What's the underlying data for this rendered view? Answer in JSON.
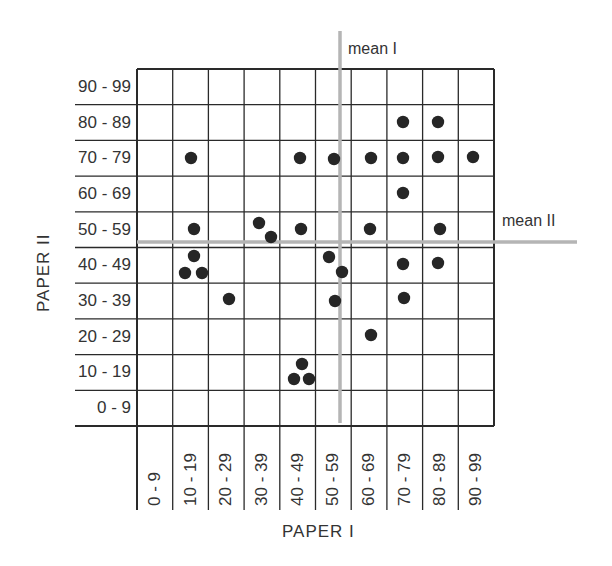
{
  "chart_data": {
    "type": "scatter",
    "title": "",
    "xlabel": "PAPER I",
    "ylabel": "PAPER II",
    "x_categories": [
      "0 - 9",
      "10 - 19",
      "20 - 29",
      "30 - 39",
      "40 - 49",
      "50 - 59",
      "60 - 69",
      "70 - 79",
      "80 - 89",
      "90 - 99"
    ],
    "y_categories": [
      "90 - 99",
      "80 - 89",
      "70 - 79",
      "60 - 69",
      "50 - 59",
      "40 - 49",
      "30 - 39",
      "20 - 29",
      "10 - 19",
      "0 - 9"
    ],
    "xlim": [
      0,
      100
    ],
    "ylim": [
      0,
      100
    ],
    "grid": true,
    "reference_lines": [
      {
        "label": "mean I",
        "axis": "x",
        "value": 57
      },
      {
        "label": "mean II",
        "axis": "y",
        "value": 48
      }
    ],
    "points_by_cell": [
      {
        "paper_I": "70 - 79",
        "paper_II": "80 - 89",
        "count": 1
      },
      {
        "paper_I": "80 - 89",
        "paper_II": "80 - 89",
        "count": 1
      },
      {
        "paper_I": "10 - 19",
        "paper_II": "70 - 79",
        "count": 1
      },
      {
        "paper_I": "40 - 49",
        "paper_II": "70 - 79",
        "count": 1
      },
      {
        "paper_I": "50 - 59",
        "paper_II": "70 - 79",
        "count": 1
      },
      {
        "paper_I": "60 - 69",
        "paper_II": "70 - 79",
        "count": 1
      },
      {
        "paper_I": "70 - 79",
        "paper_II": "70 - 79",
        "count": 1
      },
      {
        "paper_I": "80 - 89",
        "paper_II": "70 - 79",
        "count": 1
      },
      {
        "paper_I": "90 - 99",
        "paper_II": "70 - 79",
        "count": 1
      },
      {
        "paper_I": "70 - 79",
        "paper_II": "60 - 69",
        "count": 1
      },
      {
        "paper_I": "10 - 19",
        "paper_II": "50 - 59",
        "count": 1
      },
      {
        "paper_I": "30 - 39",
        "paper_II": "50 - 59",
        "count": 2
      },
      {
        "paper_I": "40 - 49",
        "paper_II": "50 - 59",
        "count": 1
      },
      {
        "paper_I": "60 - 69",
        "paper_II": "50 - 59",
        "count": 1
      },
      {
        "paper_I": "80 - 89",
        "paper_II": "50 - 59",
        "count": 1
      },
      {
        "paper_I": "10 - 19",
        "paper_II": "40 - 49",
        "count": 3
      },
      {
        "paper_I": "50 - 59",
        "paper_II": "40 - 49",
        "count": 2
      },
      {
        "paper_I": "70 - 79",
        "paper_II": "40 - 49",
        "count": 1
      },
      {
        "paper_I": "80 - 89",
        "paper_II": "40 - 49",
        "count": 1
      },
      {
        "paper_I": "20 - 29",
        "paper_II": "30 - 39",
        "count": 1
      },
      {
        "paper_I": "50 - 59",
        "paper_II": "30 - 39",
        "count": 1
      },
      {
        "paper_I": "70 - 79",
        "paper_II": "30 - 39",
        "count": 1
      },
      {
        "paper_I": "60 - 69",
        "paper_II": "20 - 29",
        "count": 1
      },
      {
        "paper_I": "40 - 49",
        "paper_II": "10 - 19",
        "count": 3
      }
    ],
    "total_points": 30
  },
  "plot": {
    "left": 137,
    "top": 69,
    "right": 494,
    "bottom": 426,
    "y_label_line_left": 75,
    "x_label_line_bottom": 510,
    "grid_color": "#2a2a2a",
    "mean_color": "#b5b5b5",
    "dot_color": "#262626",
    "dot_radius": 6.2,
    "mean_I": {
      "x": 340,
      "y1": 31,
      "y2": 423
    },
    "mean_II": {
      "y": 242,
      "x1": 137,
      "x2": 577
    },
    "dots": [
      [
        403,
        122
      ],
      [
        438,
        122
      ],
      [
        191,
        158
      ],
      [
        300,
        158
      ],
      [
        334,
        159
      ],
      [
        371,
        158
      ],
      [
        403,
        158
      ],
      [
        438,
        157
      ],
      [
        473,
        157
      ],
      [
        403,
        193
      ],
      [
        194,
        229
      ],
      [
        259,
        223
      ],
      [
        271,
        237
      ],
      [
        301,
        229
      ],
      [
        370,
        229
      ],
      [
        440,
        229
      ],
      [
        194,
        256
      ],
      [
        185,
        273
      ],
      [
        202,
        273
      ],
      [
        329,
        257
      ],
      [
        342,
        272
      ],
      [
        403,
        264
      ],
      [
        438,
        263
      ],
      [
        229,
        299
      ],
      [
        335,
        301
      ],
      [
        404,
        298
      ],
      [
        371,
        335
      ],
      [
        302,
        364
      ],
      [
        294,
        379
      ],
      [
        309,
        379
      ]
    ]
  },
  "labels": {
    "x_axis_title": "PAPER I",
    "y_axis_title": "PAPER II",
    "mean_I": "mean I",
    "mean_II": "mean II",
    "y_ticks": [
      "90 - 99",
      "80 - 89",
      "70 - 79",
      "60 - 69",
      "50 - 59",
      "40 - 49",
      "30 - 39",
      "20 - 29",
      "10 - 19",
      "0 - 9"
    ],
    "x_ticks": [
      "0 - 9",
      "10 - 19",
      "20 - 29",
      "30 - 39",
      "40 - 49",
      "50 - 59",
      "60 - 69",
      "70 - 79",
      "80 - 89",
      "90 - 99"
    ]
  }
}
